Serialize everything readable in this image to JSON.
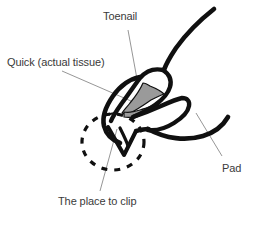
{
  "figure": {
    "background_color": "#ffffff",
    "ink_color": "#101010",
    "quick_fill_color": "#9a9a9a",
    "leader_color": "#8a8a8a",
    "label_color": "#3a3a3a"
  },
  "labels": {
    "toenail": "Toenail",
    "quick": "Quick (actual tissue)",
    "place_to_clip": "The place to clip",
    "pad": "Pad"
  },
  "parts": {
    "nail_outline": "toenail-outline",
    "quick_tissue": "quick-tissue-shape",
    "pad_curve": "pad-curve",
    "leg_curve": "leg-curve",
    "clip_zone": "dashed-clip-circle"
  }
}
